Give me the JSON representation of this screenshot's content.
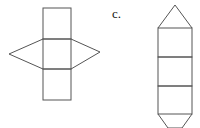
{
  "figures": [
    {
      "id": "net-b",
      "description": "Net of a square pyramid-like shape: three stacked squares with triangles on left and right of middle square"
    },
    {
      "id": "net-c",
      "label": "c.",
      "description": "Net of a triangular prism: three stacked rectangles with a triangle on top and bottom"
    }
  ],
  "colors": {
    "stroke": "#555555",
    "background": "#ffffff"
  }
}
